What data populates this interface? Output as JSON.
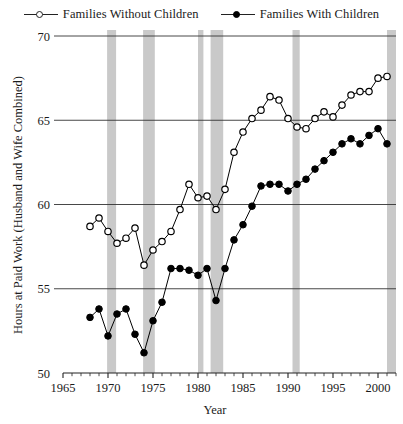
{
  "chart_data": {
    "type": "line",
    "title": "",
    "xlabel": "Year",
    "ylabel": "Hours at Paid Work (Husband and Wife Combined)",
    "xlim": [
      1965,
      2002
    ],
    "ylim": [
      50,
      70
    ],
    "xticks": [
      1965,
      1970,
      1975,
      1980,
      1985,
      1990,
      1995,
      2000
    ],
    "xtick_labels": [
      "1965",
      "1970",
      "1975",
      "1980",
      "1985",
      "1990",
      "1995",
      "2000"
    ],
    "yticks": [
      50,
      55,
      60,
      65,
      70
    ],
    "ytick_labels": [
      "50",
      "55",
      "60",
      "65",
      "70"
    ],
    "grid": "horizontal",
    "legend_position": "top-center",
    "minor_xticks": "annual",
    "series": [
      {
        "name": "Families Without Children",
        "marker": "open-circle",
        "color": "#000000",
        "x": [
          1968,
          1969,
          1970,
          1971,
          1972,
          1973,
          1974,
          1975,
          1976,
          1977,
          1978,
          1979,
          1980,
          1981,
          1982,
          1983,
          1984,
          1985,
          1986,
          1987,
          1988,
          1989,
          1990,
          1991,
          1992,
          1993,
          1994,
          1995,
          1996,
          1997,
          1998,
          1999,
          2000,
          2001
        ],
        "values": [
          58.7,
          59.2,
          58.4,
          57.7,
          58.0,
          58.6,
          56.4,
          57.3,
          57.8,
          58.4,
          59.7,
          61.2,
          60.4,
          60.5,
          59.7,
          60.9,
          63.1,
          64.3,
          65.1,
          65.6,
          66.4,
          66.2,
          65.1,
          64.6,
          64.5,
          65.1,
          65.5,
          65.2,
          65.9,
          66.5,
          66.7,
          66.7,
          67.5,
          67.6
        ]
      },
      {
        "name": "Families With Children",
        "marker": "filled-circle",
        "color": "#000000",
        "x": [
          1968,
          1969,
          1970,
          1971,
          1972,
          1973,
          1974,
          1975,
          1976,
          1977,
          1978,
          1979,
          1980,
          1981,
          1982,
          1983,
          1984,
          1985,
          1986,
          1987,
          1988,
          1989,
          1990,
          1991,
          1992,
          1993,
          1994,
          1995,
          1996,
          1997,
          1998,
          1999,
          2000,
          2001
        ],
        "values": [
          53.3,
          53.8,
          52.2,
          53.5,
          53.8,
          52.3,
          51.2,
          53.1,
          54.2,
          56.2,
          56.2,
          56.1,
          55.8,
          56.2,
          54.3,
          56.2,
          57.9,
          58.8,
          59.9,
          61.1,
          61.2,
          61.2,
          60.8,
          61.2,
          61.5,
          62.1,
          62.6,
          63.1,
          63.6,
          63.9,
          63.6,
          64.1,
          64.5,
          63.6
        ]
      }
    ],
    "shaded_bands": {
      "label": "recession-band",
      "color": "#c9c9c9",
      "ranges": [
        [
          1969.9,
          1970.9
        ],
        [
          1973.9,
          1975.2
        ],
        [
          1980.0,
          1980.6
        ],
        [
          1981.4,
          1982.8
        ],
        [
          1990.5,
          1991.3
        ],
        [
          2001.0,
          2002.0
        ]
      ]
    }
  }
}
